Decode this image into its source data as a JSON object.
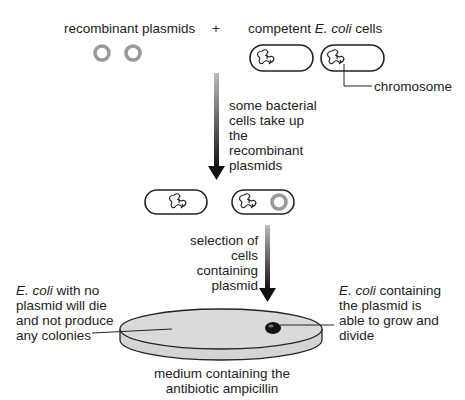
{
  "labels": {
    "recombinant_plasmids": "recombinant plasmids",
    "plus": "+",
    "competent_prefix": "competent ",
    "competent_italic": "E. coli",
    "competent_suffix": " cells",
    "chromosome": "chromosome",
    "step1": [
      "some bacterial",
      "cells take up",
      "the",
      "recombinant",
      "plasmids"
    ],
    "step2": [
      "selection of",
      "cells",
      "containing",
      "plasmid"
    ],
    "left_note_italic": "E. coli",
    "left_note_first_suffix": " with no",
    "left_note_lines": [
      "plasmid will die",
      "and not produce",
      "any colonies"
    ],
    "right_note_italic": "E. coli",
    "right_note_first_suffix": " containing",
    "right_note_lines": [
      "the plasmid is",
      "able to grow and",
      "divide"
    ],
    "medium": [
      "medium containing the",
      "antibiotic ampicillin"
    ]
  },
  "colors": {
    "plasmid": "#999999",
    "outline": "#222222",
    "dish_fill": "#d9d9d9",
    "colony": "#111111"
  }
}
